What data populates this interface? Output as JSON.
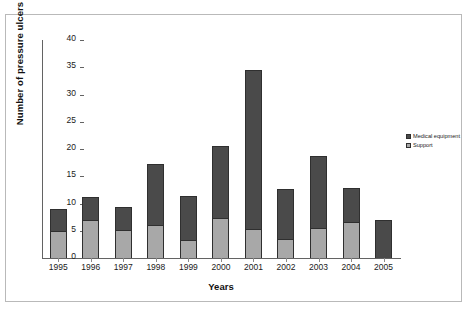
{
  "chart_data": {
    "type": "bar",
    "subtype": "stacked-vertical",
    "title": "",
    "xlabel": "Years",
    "ylabel": "Number of pressure ulcers",
    "categories": [
      "1995",
      "1996",
      "1997",
      "1998",
      "1999",
      "2000",
      "2001",
      "2002",
      "2003",
      "2004",
      "2005"
    ],
    "series": [
      {
        "name": "Support",
        "color": "#a8a8a8",
        "values": [
          5.0,
          7.0,
          5.1,
          6.1,
          3.3,
          7.3,
          5.3,
          3.5,
          5.5,
          6.7,
          0
        ]
      },
      {
        "name": "Medical equipment",
        "color": "#4a4a4a",
        "values": [
          4.0,
          4.2,
          4.2,
          11.2,
          8.1,
          13.2,
          29.2,
          9.1,
          13.3,
          6.2,
          6.9
        ]
      }
    ],
    "totals": [
      9.0,
      11.2,
      9.3,
      17.3,
      11.4,
      20.5,
      34.5,
      12.6,
      18.8,
      12.9,
      6.9
    ],
    "ylim": [
      0,
      40
    ],
    "yticks": [
      "0",
      "5",
      "10",
      "15",
      "20",
      "25",
      "30",
      "35",
      "40"
    ],
    "ytick_values": [
      0,
      5,
      10,
      15,
      20,
      25,
      30,
      35,
      40
    ],
    "grid": false,
    "legend_position": "right",
    "legend": [
      {
        "label": "Medical equipment",
        "color": "#4a4a4a"
      },
      {
        "label": "Support",
        "color": "#a8a8a8"
      }
    ]
  },
  "axis": {
    "x_title": "Years",
    "y_title": "Number of pressure ulcers"
  },
  "colors": {
    "medical_equipment": "#4a4a4a",
    "support": "#a8a8a8",
    "axis": "#636363",
    "frame": "#b9b9b9",
    "background": "#ffffff"
  }
}
